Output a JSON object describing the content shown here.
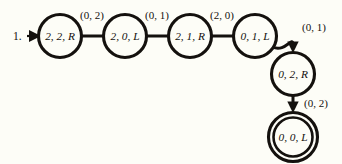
{
  "figure": {
    "item_number": "1.",
    "kind": "state-transition-diagram",
    "background_color": "#fdfdf7",
    "ink_color": "#14110e"
  },
  "states": [
    {
      "id": "s0",
      "label": "2, 2, R",
      "cx": 60,
      "cy": 36,
      "r": 21.5,
      "accepting": false,
      "is_start": true
    },
    {
      "id": "s1",
      "label": "2, 0, L",
      "cx": 125,
      "cy": 36,
      "r": 21.5,
      "accepting": false,
      "is_start": false
    },
    {
      "id": "s2",
      "label": "2, 1, R",
      "cx": 190,
      "cy": 36,
      "r": 21.5,
      "accepting": false,
      "is_start": false
    },
    {
      "id": "s3",
      "label": "0, 1, L",
      "cx": 255,
      "cy": 36,
      "r": 21.5,
      "accepting": false,
      "is_start": false
    },
    {
      "id": "s4",
      "label": "0, 2, R",
      "cx": 293,
      "cy": 74,
      "r": 21.5,
      "accepting": false,
      "is_start": false
    },
    {
      "id": "s5",
      "label": "0, 0, L",
      "cx": 293,
      "cy": 137,
      "r": 24.5,
      "r_inner": 19.5,
      "accepting": true,
      "is_start": false
    }
  ],
  "transitions": [
    {
      "id": "t0",
      "from": "s0",
      "to": "s1",
      "label": "(0, 2)",
      "label_x": 92,
      "label_y": 16,
      "style": "straight"
    },
    {
      "id": "t1",
      "from": "s1",
      "to": "s2",
      "label": "(0, 1)",
      "label_x": 157,
      "label_y": 16,
      "style": "straight"
    },
    {
      "id": "t2",
      "from": "s2",
      "to": "s3",
      "label": "(2, 0)",
      "label_x": 222,
      "label_y": 16,
      "style": "straight"
    },
    {
      "id": "t3",
      "from": "s3",
      "to": "s4",
      "label": "(0, 1)",
      "label_x": 314,
      "label_y": 28,
      "style": "curved"
    },
    {
      "id": "t4",
      "from": "s4",
      "to": "s5",
      "label": "(0, 2)",
      "label_x": 316,
      "label_y": 104,
      "style": "straight-vertical"
    }
  ],
  "start_marker": {
    "number_x": 13,
    "number_y": 36,
    "arrow_tip_x": 38,
    "arrow_tail_x": 27,
    "y": 36
  }
}
